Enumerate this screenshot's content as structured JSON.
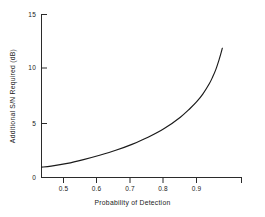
{
  "chart_data": {
    "type": "line",
    "title": "",
    "subtitle": "",
    "xlabel": "Probability of Detection",
    "ylabel": "Additional S/N Required (dB)",
    "xlim": [
      0.42,
      0.99
    ],
    "ylim": [
      0,
      15
    ],
    "grid": false,
    "legend": null,
    "xticks": [
      0.5,
      0.6,
      0.7,
      0.8,
      0.9
    ],
    "xticklabels": [
      "0.5",
      "0.6",
      "0.7",
      "0.8",
      "0.9"
    ],
    "yticks": [
      0,
      5,
      10,
      15
    ],
    "yticklabels": [
      "0",
      "5",
      "10",
      "15"
    ],
    "series": [
      {
        "name": "Additional S/N Required",
        "color": "#1a1a1a",
        "x": [
          0.42,
          0.45,
          0.5,
          0.55,
          0.6,
          0.65,
          0.7,
          0.75,
          0.8,
          0.85,
          0.88,
          0.9,
          0.92,
          0.94,
          0.95,
          0.96,
          0.97,
          0.975,
          0.98
        ],
        "y": [
          0.95,
          1.05,
          1.3,
          1.65,
          2.05,
          2.5,
          3.05,
          3.7,
          4.5,
          5.55,
          6.35,
          6.95,
          7.7,
          8.65,
          9.25,
          9.95,
          10.85,
          11.35,
          11.9
        ]
      }
    ]
  },
  "axes": {
    "x_title": "Probability of Detection",
    "y_title": "Additional S/N Required (dB)"
  }
}
